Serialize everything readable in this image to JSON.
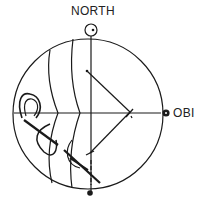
{
  "labels": {
    "north": "NORTH",
    "obi": "OBI"
  },
  "colors": {
    "stroke": "#1a1a1a",
    "background": "#ffffff"
  }
}
